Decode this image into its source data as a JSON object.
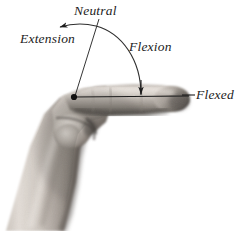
{
  "figure": {
    "background_color": "#ffffff",
    "annotation_color": "#1c1c1c",
    "width": 237,
    "height": 231
  },
  "labels": {
    "neutral": "Neutral",
    "extension": "Extension",
    "flexion": "Flexion",
    "flexed": "Flexed"
  },
  "annotations": {
    "pivot_point": {
      "x": 74,
      "y": 97,
      "name": "joint-pivot-dot"
    },
    "neutral_line": {
      "x1": 98,
      "y1": 20,
      "x2": 74,
      "y2": 97
    },
    "baseline": {
      "x1": 74,
      "y1": 97,
      "x2": 190,
      "y2": 97
    },
    "arc": {
      "from_x": 58,
      "from_y": 27,
      "to_x": 141,
      "to_y": 95,
      "direction": "extension-arrow-at-left"
    },
    "flexed_leader": {
      "x1": 183,
      "y1": 95,
      "x2": 196,
      "y2": 95
    }
  },
  "colors": {
    "ink": "#1c1c1c",
    "arc": "#3a3a3a",
    "background": "#ffffff",
    "skin_highlight": "#e8e2dc",
    "skin_mid": "#b2aaa3",
    "skin_shadow": "#6e6862",
    "skin_deep_shadow": "#474240"
  }
}
